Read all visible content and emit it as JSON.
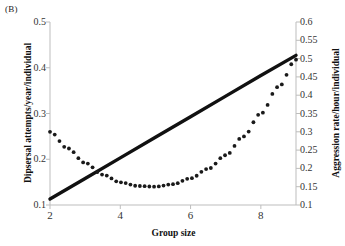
{
  "panel": {
    "label": "(B)"
  },
  "axes": {
    "x": {
      "title": "Group size",
      "ticks": [
        2,
        4,
        6,
        8
      ],
      "range": [
        2,
        9
      ]
    },
    "y_left": {
      "title": "Dipsersal attempts/year/individual",
      "ticks": [
        "0.1",
        "0.2",
        "0.3",
        "0.4",
        "0.5"
      ],
      "range": [
        0.1,
        0.5
      ]
    },
    "y_right": {
      "title": "Aggression rate/hour/individual",
      "ticks": [
        "0.1",
        "0.15",
        "0.2",
        "0.25",
        "0.3",
        "0.35",
        "0.4",
        "0.45",
        "0.5",
        "0.55",
        "0.6"
      ],
      "range": [
        0.1,
        0.6
      ]
    }
  },
  "style": {
    "solid_color": "#111111",
    "dotted_color": "#1a1a1a",
    "axis_color": "#bdbdbd",
    "background": "#ffffff"
  },
  "chart_data": {
    "type": "line",
    "title": "",
    "xlabel": "Group size",
    "ylabel": "Dipsersal attempts/year/individual",
    "ylabel_secondary": "Aggression rate/hour/individual",
    "xlim": [
      2,
      9
    ],
    "ylim": [
      0.1,
      0.5
    ],
    "ylim_secondary": [
      0.1,
      0.6
    ],
    "grid": false,
    "legend": "none",
    "series": [
      {
        "name": "Dipsersal attempts/year/individual",
        "axis": "left",
        "style": "solid",
        "x": [
          2,
          3,
          4,
          5,
          6,
          7,
          8,
          9
        ],
        "values": [
          0.113,
          0.158,
          0.203,
          0.248,
          0.293,
          0.338,
          0.383,
          0.427
        ]
      },
      {
        "name": "Aggression rate/hour/individual",
        "axis": "right",
        "style": "dotted",
        "x": [
          2,
          2.5,
          3,
          3.5,
          4,
          4.5,
          5,
          5.5,
          6,
          6.5,
          7,
          7.5,
          8,
          8.5,
          9
        ],
        "values": [
          0.3,
          0.255,
          0.215,
          0.183,
          0.162,
          0.152,
          0.15,
          0.157,
          0.173,
          0.199,
          0.236,
          0.287,
          0.35,
          0.423,
          0.497
        ]
      }
    ]
  }
}
